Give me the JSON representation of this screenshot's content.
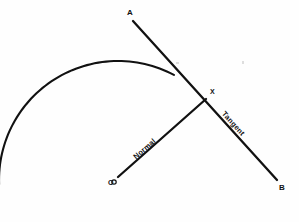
{
  "figure": {
    "background_color": "#fefefe",
    "ink_color": "#111111",
    "labels": {
      "point_a": "A",
      "point_b": "B",
      "point_x": "X",
      "point_o": "O",
      "tangent": "Tangent",
      "normal": "Normal"
    },
    "geometry": {
      "arc": {
        "center_x": 118,
        "center_y": 180,
        "radius": 119,
        "start_angle_deg": 182,
        "end_angle_deg": 62,
        "description": "circular arc centred at O passing through X"
      },
      "tangent_line": {
        "from_x": 133,
        "from_y": 21,
        "to_x": 277,
        "to_y": 180,
        "from_label": "A",
        "to_label": "B"
      },
      "normal_line": {
        "from_x": 118,
        "from_y": 177,
        "to_x": 206,
        "to_y": 99,
        "from_label": "O",
        "to_label": "X"
      },
      "point_x": {
        "x": 206,
        "y": 99
      },
      "label_positions": {
        "point_a": {
          "x": 127,
          "y": 9
        },
        "point_b": {
          "x": 279,
          "y": 184
        },
        "point_x": {
          "x": 210,
          "y": 88
        },
        "point_o": {
          "x": 108,
          "y": 179
        },
        "tangent": {
          "x": 226,
          "y": 110,
          "rotation_deg": 48
        },
        "normal": {
          "x": 132,
          "y": 155,
          "rotation_deg": -41
        }
      }
    }
  }
}
